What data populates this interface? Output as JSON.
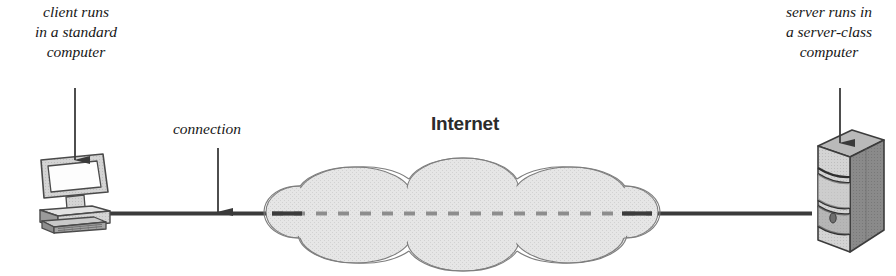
{
  "figure": {
    "background_color": "#ffffff"
  },
  "annotations": {
    "client": {
      "name": "client-annotation",
      "lines": [
        "client runs",
        "in a standard",
        "computer"
      ],
      "text": "client runs in a standard computer"
    },
    "server": {
      "name": "server-annotation",
      "lines": [
        "server runs in",
        "a server-class",
        "computer"
      ],
      "text": "server runs in a server-class computer"
    },
    "connection": {
      "name": "connection-annotation",
      "lines": [
        "connection"
      ],
      "text": "connection"
    }
  },
  "labels": {
    "internet": "Internet"
  },
  "nodes": {
    "client": {
      "icon": "desktop-computer-icon",
      "description": "desktop computer with monitor and keyboard"
    },
    "server": {
      "icon": "server-tower-icon",
      "description": "server-class tower computer"
    },
    "network": {
      "icon": "cloud-icon",
      "description": "internet cloud"
    }
  },
  "link": {
    "name": "connection-line",
    "style": "solid outside cloud, dashed inside cloud"
  },
  "colors": {
    "line": "#3b3b3b",
    "dash": "#8d8d8d",
    "cloud_fill": "#e3e3e3",
    "cloud_stroke": "#7d7d7d",
    "device_light": "#d9d9d9",
    "device_mid": "#b3b3b3",
    "device_dark": "#6f6f6f",
    "text": "#171717",
    "internet_label": "#2b2b2b"
  }
}
